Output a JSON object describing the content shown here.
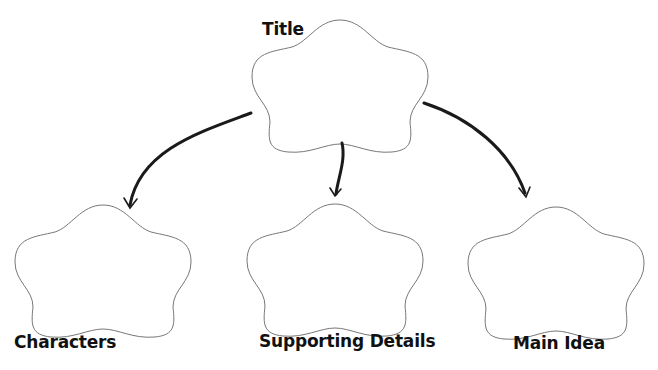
{
  "diagram": {
    "type": "graphic-organizer",
    "nodes": [
      {
        "id": "title",
        "label": "Title"
      },
      {
        "id": "characters",
        "label": "Characters"
      },
      {
        "id": "supporting",
        "label": "Supporting Details"
      },
      {
        "id": "main",
        "label": "Main Idea"
      }
    ],
    "edges": [
      {
        "from": "title",
        "to": "characters"
      },
      {
        "from": "title",
        "to": "supporting"
      },
      {
        "from": "title",
        "to": "main"
      }
    ],
    "colors": {
      "outline": "#777777",
      "arrow": "#1a1a1a",
      "text": "#111111",
      "background": "#ffffff"
    }
  }
}
